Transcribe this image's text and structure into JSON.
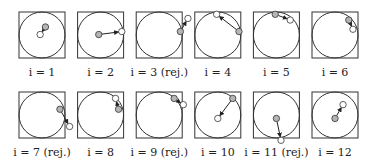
{
  "figure": {
    "colors": {
      "current": "#b5b5b5",
      "proposal": "#ffffff",
      "stroke": "#333333"
    },
    "panels": [
      {
        "label": "i = 1",
        "rejected": false,
        "from": [
          0.15,
          0.35
        ],
        "to": [
          -0.08,
          0.02
        ]
      },
      {
        "label": "i = 2",
        "rejected": false,
        "from": [
          -0.08,
          0.02
        ],
        "to": [
          0.92,
          0.15
        ]
      },
      {
        "label": "i = 3 (rej.)",
        "rejected": true,
        "from": [
          0.92,
          0.15
        ],
        "to": [
          1.25,
          0.72
        ]
      },
      {
        "label": "i = 4",
        "rejected": false,
        "from": [
          0.92,
          0.15
        ],
        "to": [
          -0.05,
          0.9
        ]
      },
      {
        "label": "i = 5",
        "rejected": false,
        "from": [
          -0.05,
          0.9
        ],
        "to": [
          0.6,
          0.65
        ]
      },
      {
        "label": "i = 6",
        "rejected": false,
        "from": [
          0.6,
          0.65
        ],
        "to": [
          0.78,
          0.25
        ]
      },
      {
        "label": "i = 7 (rej.)",
        "rejected": true,
        "from": [
          0.78,
          0.25
        ],
        "to": [
          1.2,
          -0.5
        ]
      },
      {
        "label": "i = 8",
        "rejected": false,
        "from": [
          0.78,
          0.25
        ],
        "to": [
          0.65,
          0.72
        ]
      },
      {
        "label": "i = 9 (rej.)",
        "rejected": true,
        "from": [
          0.65,
          0.72
        ],
        "to": [
          1.05,
          0.45
        ]
      },
      {
        "label": "i = 10",
        "rejected": false,
        "from": [
          0.65,
          0.72
        ],
        "to": [
          0.0,
          -0.15
        ]
      },
      {
        "label": "i = 11 (rej.)",
        "rejected": true,
        "from": [
          0.0,
          -0.15
        ],
        "to": [
          0.2,
          -1.1
        ]
      },
      {
        "label": "i = 12",
        "rejected": false,
        "from": [
          0.0,
          -0.15
        ],
        "to": [
          0.35,
          0.45
        ]
      }
    ]
  }
}
